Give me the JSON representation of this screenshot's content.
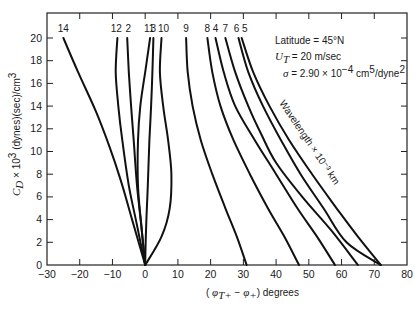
{
  "chart_data": {
    "type": "line",
    "title": "",
    "xlabel": "(φT+ − φ+) degrees",
    "ylabel": "C_D × 10³ (dynes)(sec)/cm³",
    "xlim": [
      -30,
      80
    ],
    "ylim": [
      0,
      20
    ],
    "xticks": [
      -30,
      -20,
      -10,
      0,
      10,
      20,
      30,
      40,
      50,
      60,
      70,
      80
    ],
    "yticks": [
      0,
      2,
      4,
      6,
      8,
      10,
      12,
      14,
      16,
      18,
      20
    ],
    "grid": false,
    "legend": "curve labels at top (wavelength × 10⁻³ km)",
    "annotations": [
      "Latitude = 45°N",
      "U_T = 20 m/sec",
      "σ = 2.90 × 10⁻⁴ cm⁵/dyne²",
      "Wavelength × 10⁻³ km"
    ],
    "series": [
      {
        "name": "14",
        "points": [
          [
            -25,
            20
          ],
          [
            -20.5,
            17
          ],
          [
            -15,
            13.5
          ],
          [
            -11,
            10.5
          ],
          [
            -7.5,
            7.5
          ],
          [
            -4,
            4
          ],
          [
            0,
            0
          ]
        ]
      },
      {
        "name": "12",
        "points": [
          [
            -8.5,
            20
          ],
          [
            -9,
            17
          ],
          [
            -8.2,
            14
          ],
          [
            -7,
            11
          ],
          [
            -5,
            7
          ],
          [
            -2.5,
            3.5
          ],
          [
            0,
            0
          ]
        ]
      },
      {
        "name": "2",
        "points": [
          [
            -5.5,
            20
          ],
          [
            -5,
            17
          ],
          [
            -4.3,
            14
          ],
          [
            -3.5,
            11
          ],
          [
            -2.5,
            7
          ],
          [
            -1.2,
            3.5
          ],
          [
            0,
            0
          ]
        ]
      },
      {
        "name": "11",
        "points": [
          [
            1.5,
            20
          ],
          [
            0,
            17
          ],
          [
            -1.5,
            14
          ],
          [
            -2.2,
            11
          ],
          [
            -2.2,
            7
          ],
          [
            -1.2,
            3.5
          ],
          [
            0,
            0
          ]
        ]
      },
      {
        "name": "3",
        "points": [
          [
            2.5,
            20
          ],
          [
            2.2,
            17
          ],
          [
            1.8,
            14
          ],
          [
            1.3,
            11
          ],
          [
            0.8,
            7
          ],
          [
            0.3,
            3.5
          ],
          [
            0,
            0
          ]
        ]
      },
      {
        "name": "10",
        "points": [
          [
            5,
            20
          ],
          [
            4.5,
            17
          ],
          [
            5.5,
            14
          ],
          [
            7,
            11
          ],
          [
            8,
            8
          ],
          [
            7.5,
            5
          ],
          [
            5,
            2.5
          ],
          [
            0,
            0
          ]
        ]
      },
      {
        "name": "9",
        "points": [
          [
            12.5,
            20
          ],
          [
            13,
            17
          ],
          [
            14.5,
            14
          ],
          [
            17,
            11
          ],
          [
            20.5,
            8
          ],
          [
            24.5,
            5
          ],
          [
            28,
            2.5
          ],
          [
            31,
            0
          ]
        ]
      },
      {
        "name": "8",
        "points": [
          [
            19,
            20
          ],
          [
            20.5,
            17
          ],
          [
            23,
            14
          ],
          [
            27,
            11
          ],
          [
            32,
            8
          ],
          [
            37.5,
            5
          ],
          [
            42.5,
            2.5
          ],
          [
            47,
            0
          ]
        ]
      },
      {
        "name": "4",
        "points": [
          [
            21.5,
            20
          ],
          [
            24,
            17
          ],
          [
            27.5,
            14
          ],
          [
            33.5,
            11
          ],
          [
            40,
            8
          ],
          [
            46.5,
            5
          ],
          [
            52.5,
            2.5
          ],
          [
            58,
            0
          ]
        ]
      },
      {
        "name": "7",
        "points": [
          [
            24.5,
            20
          ],
          [
            27.5,
            17
          ],
          [
            31.5,
            14
          ],
          [
            35.5,
            11.5
          ],
          [
            40,
            9
          ],
          [
            48,
            6
          ],
          [
            57,
            3
          ],
          [
            65,
            0
          ]
        ]
      },
      {
        "name": "6",
        "points": [
          [
            28.5,
            20
          ],
          [
            31.5,
            17
          ],
          [
            36,
            14
          ],
          [
            41.5,
            11
          ],
          [
            47.5,
            8
          ],
          [
            54.5,
            5
          ],
          [
            61.5,
            2
          ],
          [
            72,
            0
          ]
        ]
      },
      {
        "name": "5",
        "points": [
          [
            29.5,
            20
          ],
          [
            33,
            17
          ],
          [
            38,
            14
          ],
          [
            44,
            11
          ],
          [
            51,
            8
          ],
          [
            58.5,
            5
          ],
          [
            65,
            2.5
          ],
          [
            72,
            0
          ]
        ]
      }
    ]
  },
  "text": {
    "annotation_latitude": "Latitude = 45°N",
    "annotation_ut_sym": "U",
    "annotation_ut_sub": "T",
    "annotation_ut_val": " = 20 m/sec",
    "annotation_sigma_sym": "σ",
    "annotation_sigma_val": " = 2.90 × 10",
    "annotation_sigma_exp": "−4",
    "annotation_sigma_unit": " cm",
    "annotation_sigma_unit_exp": "5",
    "annotation_sigma_unit_tail": "/dyne",
    "annotation_sigma_unit_tail_exp": "2",
    "wavelength_label": "Wavelength × 10⁻³ km",
    "xlabel_open": "( ",
    "xlabel_phi1": "φ",
    "xlabel_sub1": "T+",
    "xlabel_mid": " − ",
    "xlabel_phi2": "φ",
    "xlabel_sub2": "+",
    "xlabel_close": ")  degrees",
    "ylabel_c": "C",
    "ylabel_sub": "D",
    "ylabel_mid": " × 10",
    "ylabel_exp": "3",
    "ylabel_units": "  (dynes)(sec)/cm",
    "ylabel_units_exp": "3"
  }
}
